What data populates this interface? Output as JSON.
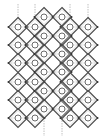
{
  "diagram": {
    "type": "diamond-lattice",
    "colors": {
      "background": "#ffffff",
      "diamond_stroke": "#4a4a4a",
      "circle_stroke": "#6a6a6a",
      "guide": "#b0b0b0",
      "node": "#333333"
    },
    "diamond_half": 9.5,
    "circle_radius": 3,
    "columns_a": {
      "x": [
        18,
        35,
        70,
        88
      ],
      "y": [
        27,
        45,
        63,
        82,
        100,
        118
      ]
    },
    "columns_b": {
      "x": [
        44,
        62
      ],
      "y": [
        17,
        36,
        54,
        72,
        91,
        109
      ]
    },
    "top_guides_x": [
      18,
      35,
      70,
      88
    ],
    "bottom_guides_x": [
      44,
      62
    ]
  }
}
